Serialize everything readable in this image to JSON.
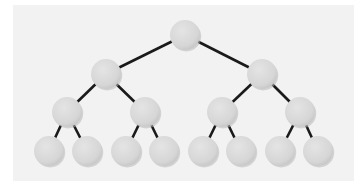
{
  "diagram": {
    "type": "binary-tree",
    "levels": 4,
    "colors": {
      "background": "#ffffff",
      "panel": "#f2f2f2",
      "node_fill": "#d9d9d9",
      "node_shadow": "#b8b8b8",
      "edge": "#1a1a1a"
    },
    "node_radius": 15,
    "nodes": [
      {
        "id": "n0",
        "x": 185,
        "y": 35
      },
      {
        "id": "n1",
        "x": 106,
        "y": 74
      },
      {
        "id": "n2",
        "x": 262,
        "y": 74
      },
      {
        "id": "n3",
        "x": 67,
        "y": 112
      },
      {
        "id": "n4",
        "x": 145,
        "y": 112
      },
      {
        "id": "n5",
        "x": 222,
        "y": 112
      },
      {
        "id": "n6",
        "x": 300,
        "y": 112
      },
      {
        "id": "n7",
        "x": 49,
        "y": 151
      },
      {
        "id": "n8",
        "x": 87,
        "y": 151
      },
      {
        "id": "n9",
        "x": 126,
        "y": 151
      },
      {
        "id": "n10",
        "x": 164,
        "y": 151
      },
      {
        "id": "n11",
        "x": 203,
        "y": 151
      },
      {
        "id": "n12",
        "x": 241,
        "y": 151
      },
      {
        "id": "n13",
        "x": 280,
        "y": 151
      },
      {
        "id": "n14",
        "x": 318,
        "y": 151
      }
    ],
    "edges": [
      [
        "n0",
        "n1"
      ],
      [
        "n0",
        "n2"
      ],
      [
        "n1",
        "n3"
      ],
      [
        "n1",
        "n4"
      ],
      [
        "n2",
        "n5"
      ],
      [
        "n2",
        "n6"
      ],
      [
        "n3",
        "n7"
      ],
      [
        "n3",
        "n8"
      ],
      [
        "n4",
        "n9"
      ],
      [
        "n4",
        "n10"
      ],
      [
        "n5",
        "n11"
      ],
      [
        "n5",
        "n12"
      ],
      [
        "n6",
        "n13"
      ],
      [
        "n6",
        "n14"
      ]
    ]
  }
}
